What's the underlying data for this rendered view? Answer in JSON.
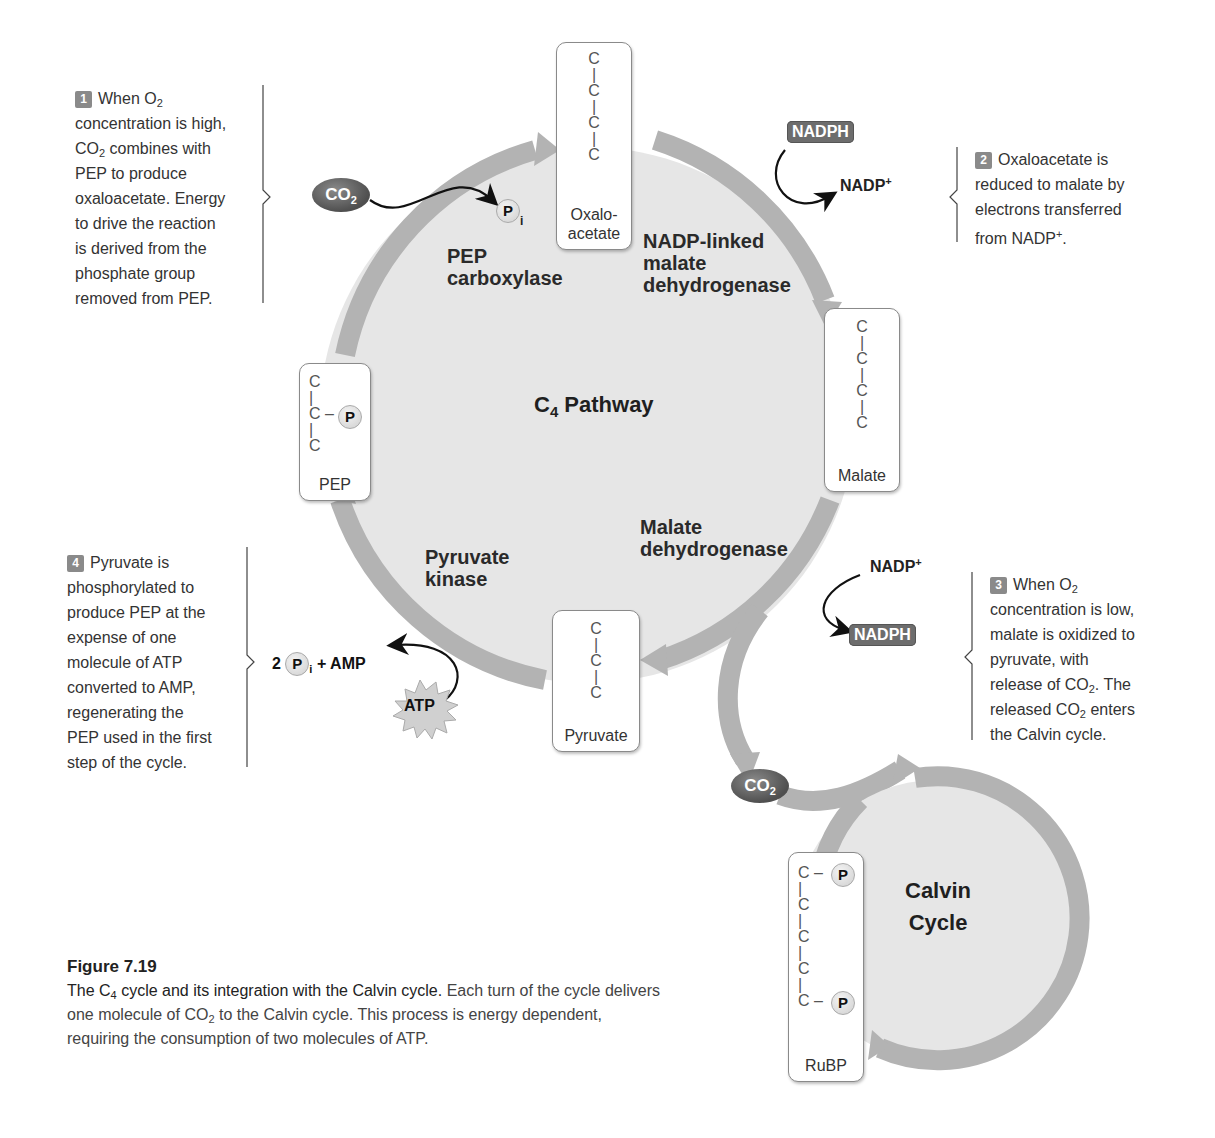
{
  "notes": {
    "n1": {
      "num": "1",
      "lines": [
        "When O",
        "concentration is high,",
        "CO",
        "combines with",
        "PEP to produce",
        "oxaloacetate. Energy",
        "to drive the reaction",
        "is derived from the",
        "phosphate group",
        "removed from PEP."
      ],
      "sub": "2"
    },
    "n2": {
      "num": "2",
      "lines": [
        "Oxaloacetate is",
        "reduced to malate by",
        "electrons transferred",
        "from NADP"
      ],
      "sup": "+",
      "end": "."
    },
    "n3": {
      "num": "3",
      "lines": [
        "When O",
        "concentration is low,",
        "malate is oxidized to",
        "pyruvate, with",
        "release of CO",
        ". The",
        "released CO",
        "enters",
        "the Calvin cycle."
      ],
      "sub": "2"
    },
    "n4": {
      "num": "4",
      "lines": [
        "Pyruvate is",
        "phosphorylated to",
        "produce PEP at the",
        "expense of one",
        "molecule of ATP",
        "converted to AMP,",
        "regenerating the",
        "PEP used in the first",
        "step of the cycle."
      ]
    }
  },
  "molecules": {
    "oxaloacetate": {
      "label_1": "Oxalo-",
      "label_2": "acetate",
      "chain": [
        "C",
        "|",
        "C",
        "|",
        "C",
        "|",
        "C"
      ]
    },
    "malate": {
      "label": "Malate",
      "chain": [
        "C",
        "|",
        "C",
        "|",
        "C",
        "|",
        "C"
      ]
    },
    "pyruvate": {
      "label": "Pyruvate",
      "chain": [
        "C",
        "|",
        "C",
        "|",
        "C"
      ]
    },
    "pep": {
      "label": "PEP",
      "chain": [
        "C",
        "|",
        "C",
        "|",
        "C"
      ],
      "bond": "–",
      "phosphate": "P"
    },
    "rubp": {
      "label": "RuBP",
      "chain": [
        "C",
        "|",
        "C",
        "|",
        "C",
        "|",
        "C",
        "|",
        "C"
      ],
      "bond": "–",
      "phosphate": "P"
    }
  },
  "enzymes": {
    "pep_carboxylase": [
      "PEP",
      "carboxylase"
    ],
    "nadp_malate_dh": [
      "NADP-linked",
      "malate",
      "dehydrogenase"
    ],
    "malate_dh": [
      "Malate",
      "dehydrogenase"
    ],
    "pyruvate_kinase": [
      "Pyruvate",
      "kinase"
    ]
  },
  "cycles": {
    "c4": {
      "prefix": "C",
      "sub": "4",
      "suffix": " Pathway"
    },
    "calvin": [
      "Calvin",
      "Cycle"
    ]
  },
  "cofactors": {
    "nadph_top": "NADPH",
    "nadp_top": "NADP",
    "nadp_bottom": "NADP",
    "nadph_bottom": "NADPH",
    "plus": "+",
    "co2_top": {
      "text": "CO",
      "sub": "2"
    },
    "co2_bottom": {
      "text": "CO",
      "sub": "2"
    },
    "pi_top": {
      "text": "P",
      "sub": "i"
    },
    "atp": "ATP",
    "products": {
      "coef": "2",
      "p": "P",
      "sub": "i",
      "rest": "+ AMP"
    }
  },
  "caption": {
    "figure": "Figure 7.19",
    "lead_1": "The C",
    "lead_sub": "4",
    "lead_2": " cycle and its integration with the Calvin cycle.",
    "body_1": " Each turn of the cycle delivers one molecule of CO",
    "body_sub": "2",
    "body_2": " to the Calvin cycle. This process is energy dependent, requiring the consumption of two molecules of ATP."
  },
  "colors": {
    "cycle_fill": "#e6e6e6",
    "arrow": "#b3b3b3",
    "badge": "#8a8a8a",
    "nadph_bg": "#6d6d6d"
  }
}
